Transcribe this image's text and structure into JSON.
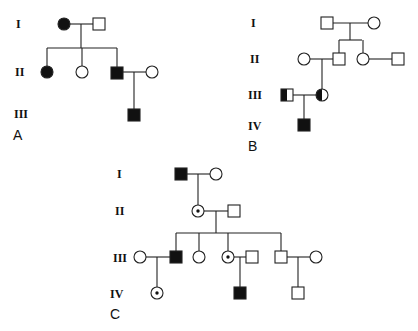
{
  "figure": {
    "colors": {
      "affected": "#111111",
      "unaffected": "#ffffff",
      "stroke": "#222222"
    }
  },
  "legend_symbols": {
    "square": "male",
    "circle": "female",
    "filled": "affected",
    "half-filled": "heterozygous carrier",
    "dot-in-circle": "obligate carrier (X-linked)"
  },
  "pedigrees": [
    {
      "label": "A",
      "generations": [
        "I",
        "II",
        "III"
      ],
      "individuals": [
        {
          "id": "A-I-1",
          "gen": "I",
          "sex": "female",
          "status": "affected"
        },
        {
          "id": "A-I-2",
          "gen": "I",
          "sex": "male",
          "status": "unaffected"
        },
        {
          "id": "A-II-1",
          "gen": "II",
          "sex": "female",
          "status": "affected"
        },
        {
          "id": "A-II-2",
          "gen": "II",
          "sex": "female",
          "status": "unaffected"
        },
        {
          "id": "A-II-3",
          "gen": "II",
          "sex": "male",
          "status": "affected"
        },
        {
          "id": "A-II-4",
          "gen": "II",
          "sex": "female",
          "status": "unaffected"
        },
        {
          "id": "A-III-1",
          "gen": "III",
          "sex": "male",
          "status": "affected"
        }
      ]
    },
    {
      "label": "B",
      "generations": [
        "I",
        "II",
        "III",
        "IV"
      ],
      "individuals": [
        {
          "id": "B-I-1",
          "gen": "I",
          "sex": "male",
          "status": "unaffected"
        },
        {
          "id": "B-I-2",
          "gen": "I",
          "sex": "female",
          "status": "unaffected"
        },
        {
          "id": "B-II-1",
          "gen": "II",
          "sex": "female",
          "status": "unaffected"
        },
        {
          "id": "B-II-2",
          "gen": "II",
          "sex": "male",
          "status": "unaffected"
        },
        {
          "id": "B-II-3",
          "gen": "II",
          "sex": "female",
          "status": "unaffected"
        },
        {
          "id": "B-II-4",
          "gen": "II",
          "sex": "male",
          "status": "unaffected"
        },
        {
          "id": "B-III-1",
          "gen": "III",
          "sex": "male",
          "status": "carrier"
        },
        {
          "id": "B-III-2",
          "gen": "III",
          "sex": "female",
          "status": "carrier"
        },
        {
          "id": "B-IV-1",
          "gen": "IV",
          "sex": "male",
          "status": "affected"
        }
      ]
    },
    {
      "label": "C",
      "generations": [
        "I",
        "II",
        "III",
        "IV"
      ],
      "individuals": [
        {
          "id": "C-I-1",
          "gen": "I",
          "sex": "male",
          "status": "affected"
        },
        {
          "id": "C-I-2",
          "gen": "I",
          "sex": "female",
          "status": "unaffected"
        },
        {
          "id": "C-II-1",
          "gen": "II",
          "sex": "female",
          "status": "carrier"
        },
        {
          "id": "C-II-2",
          "gen": "II",
          "sex": "male",
          "status": "unaffected"
        },
        {
          "id": "C-III-1",
          "gen": "III",
          "sex": "female",
          "status": "unaffected"
        },
        {
          "id": "C-III-2",
          "gen": "III",
          "sex": "male",
          "status": "affected"
        },
        {
          "id": "C-III-3",
          "gen": "III",
          "sex": "female",
          "status": "unaffected"
        },
        {
          "id": "C-III-4",
          "gen": "III",
          "sex": "female",
          "status": "carrier"
        },
        {
          "id": "C-III-5",
          "gen": "III",
          "sex": "male",
          "status": "unaffected"
        },
        {
          "id": "C-III-6",
          "gen": "III",
          "sex": "male",
          "status": "unaffected"
        },
        {
          "id": "C-III-7",
          "gen": "III",
          "sex": "female",
          "status": "unaffected"
        },
        {
          "id": "C-IV-1",
          "gen": "IV",
          "sex": "female",
          "status": "carrier"
        },
        {
          "id": "C-IV-2",
          "gen": "IV",
          "sex": "male",
          "status": "affected"
        },
        {
          "id": "C-IV-3",
          "gen": "IV",
          "sex": "male",
          "status": "unaffected"
        }
      ]
    }
  ],
  "labels": {
    "A": {
      "panel": "A",
      "gen": [
        "I",
        "II",
        "III"
      ]
    },
    "B": {
      "panel": "B",
      "gen": [
        "I",
        "II",
        "III",
        "IV"
      ]
    },
    "C": {
      "panel": "C",
      "gen": [
        "I",
        "II",
        "III",
        "IV"
      ]
    }
  }
}
